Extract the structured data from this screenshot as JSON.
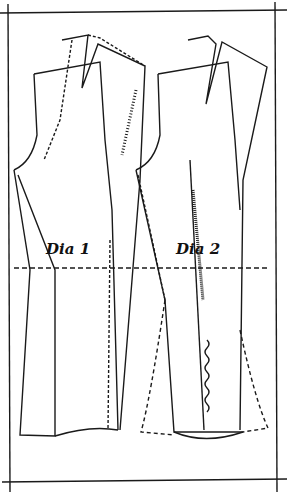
{
  "diagram": {
    "labels": {
      "dia1": "Dia 1",
      "dia2": "Dia 2"
    },
    "colors": {
      "ink": "#1a1a1a",
      "paper": "#ffffff"
    }
  }
}
